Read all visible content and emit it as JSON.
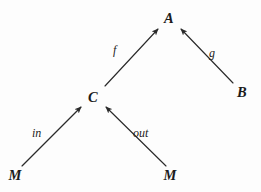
{
  "diagram": {
    "type": "commutative-diagram",
    "background_color": "#fdfdfd",
    "ink_color": "#2a2a2a",
    "width": 261,
    "height": 192,
    "nodes": [
      {
        "id": "A",
        "label": "A",
        "x": 169,
        "y": 18,
        "role": "codomain-apex"
      },
      {
        "id": "B",
        "label": "B",
        "x": 242,
        "y": 92,
        "role": "object"
      },
      {
        "id": "C",
        "label": "C",
        "x": 93,
        "y": 97,
        "role": "object"
      },
      {
        "id": "M1",
        "label": "M",
        "x": 15,
        "y": 175,
        "role": "source"
      },
      {
        "id": "M2",
        "label": "M",
        "x": 170,
        "y": 175,
        "role": "source"
      }
    ],
    "edges": [
      {
        "id": "f",
        "label": "f",
        "from": "C",
        "to": "A",
        "x1": 105,
        "y1": 86,
        "x2": 158,
        "y2": 29,
        "label_x": 113,
        "label_y": 44
      },
      {
        "id": "g",
        "label": "g",
        "from": "B",
        "to": "A",
        "x1": 233,
        "y1": 83,
        "x2": 181,
        "y2": 29,
        "label_x": 209,
        "label_y": 47
      },
      {
        "id": "in",
        "label": "in",
        "from": "M1",
        "to": "C",
        "x1": 22,
        "y1": 166,
        "x2": 81,
        "y2": 107,
        "label_x": 32,
        "label_y": 127
      },
      {
        "id": "out",
        "label": "out",
        "from": "M2",
        "to": "C",
        "x1": 166,
        "y1": 166,
        "x2": 106,
        "y2": 107,
        "label_x": 133,
        "label_y": 127
      }
    ]
  }
}
